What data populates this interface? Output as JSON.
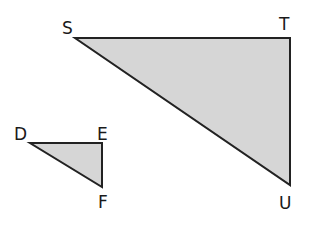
{
  "colors": {
    "fill": "#d6d6d6",
    "stroke": "#222222",
    "label": "#1a1a1a",
    "background": "#ffffff"
  },
  "triangles": [
    {
      "name": "STU",
      "vertices": [
        {
          "label": "S",
          "x": 75,
          "y": 38,
          "lx": 62,
          "ly": 34
        },
        {
          "label": "T",
          "x": 290,
          "y": 38,
          "lx": 279,
          "ly": 30
        },
        {
          "label": "U",
          "x": 290,
          "y": 185,
          "lx": 279,
          "ly": 209
        }
      ]
    },
    {
      "name": "DEF",
      "vertices": [
        {
          "label": "D",
          "x": 30,
          "y": 143,
          "lx": 14,
          "ly": 140
        },
        {
          "label": "E",
          "x": 102,
          "y": 143,
          "lx": 97,
          "ly": 140
        },
        {
          "label": "F",
          "x": 102,
          "y": 187,
          "lx": 98,
          "ly": 208
        }
      ]
    }
  ]
}
